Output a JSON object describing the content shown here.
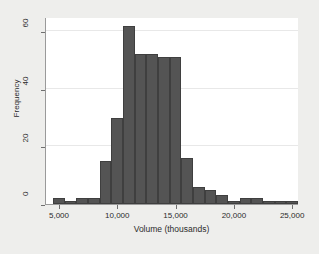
{
  "chart_data": {
    "type": "bar",
    "title": "",
    "subtitle": "",
    "xlabel": "Volume (thousands)",
    "ylabel": "Frequency",
    "xlim": [
      3800,
      25500
    ],
    "ylim": [
      0,
      65
    ],
    "grid": true,
    "legend": null,
    "bin_width": 1000,
    "bar_color": "#545454",
    "bar_edge_color": "#3f3f3f",
    "plot_background": "#ffffff",
    "figure_background": "#eeeeec",
    "axis_color": "#9a9a9a",
    "xticks": [
      5000,
      10000,
      15000,
      20000,
      25000
    ],
    "xtick_labels": [
      "5,000",
      "10,000",
      "15,000",
      "20,000",
      "25,000"
    ],
    "yticks": [
      0,
      20,
      40,
      60
    ],
    "ytick_labels": [
      "0",
      "20",
      "40",
      "60"
    ],
    "bins": [
      {
        "x0": 4400,
        "x1": 5400,
        "value": 2
      },
      {
        "x0": 5400,
        "x1": 6400,
        "value": 1
      },
      {
        "x0": 6400,
        "x1": 7400,
        "value": 2
      },
      {
        "x0": 7400,
        "x1": 8400,
        "value": 2
      },
      {
        "x0": 8400,
        "x1": 9400,
        "value": 15
      },
      {
        "x0": 9400,
        "x1": 10400,
        "value": 30
      },
      {
        "x0": 10400,
        "x1": 11400,
        "value": 62
      },
      {
        "x0": 11400,
        "x1": 12400,
        "value": 52
      },
      {
        "x0": 12400,
        "x1": 13400,
        "value": 52
      },
      {
        "x0": 13400,
        "x1": 14400,
        "value": 51
      },
      {
        "x0": 14400,
        "x1": 15400,
        "value": 51
      },
      {
        "x0": 15400,
        "x1": 16400,
        "value": 16
      },
      {
        "x0": 16400,
        "x1": 17400,
        "value": 6
      },
      {
        "x0": 17400,
        "x1": 18400,
        "value": 5
      },
      {
        "x0": 18400,
        "x1": 19400,
        "value": 3
      },
      {
        "x0": 19400,
        "x1": 20400,
        "value": 1
      },
      {
        "x0": 20400,
        "x1": 21400,
        "value": 2
      },
      {
        "x0": 21400,
        "x1": 22400,
        "value": 2
      },
      {
        "x0": 22400,
        "x1": 23400,
        "value": 1
      },
      {
        "x0": 23400,
        "x1": 24400,
        "value": 1
      },
      {
        "x0": 24400,
        "x1": 25400,
        "value": 1
      }
    ]
  }
}
